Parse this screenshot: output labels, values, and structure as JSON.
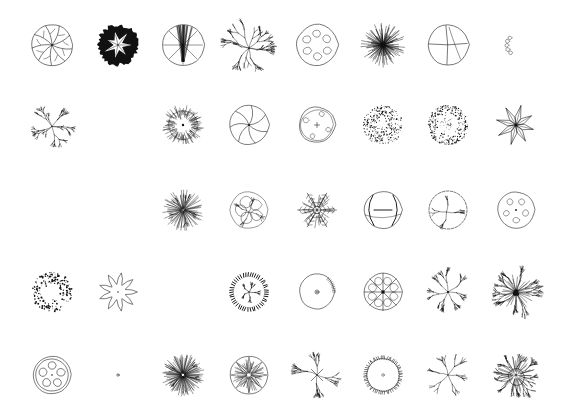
{
  "sheet": {
    "title": "Tree Plan Symbols Reference Sheet",
    "background_color": "#ffffff",
    "ink_color": "#111111",
    "width": 574,
    "height": 417,
    "columns": 8,
    "rows": 5,
    "total_symbols": 40,
    "column_centers_x": [
      52,
      118,
      183,
      249,
      317,
      383,
      448,
      516
    ],
    "row_centers_y": [
      45,
      125,
      210,
      292,
      375
    ]
  },
  "symbols": [
    {
      "id": "r1c1",
      "row": 1,
      "col": 1,
      "cx": 52,
      "cy": 45,
      "size": 52,
      "style": "segmented-canopy",
      "label": "Segmented canopy with radiating veins"
    },
    {
      "id": "r1c2",
      "row": 1,
      "col": 2,
      "cx": 118,
      "cy": 45,
      "size": 52,
      "style": "solid-filled-leaf",
      "label": "Solid filled canopy with white leaf center"
    },
    {
      "id": "r1c3",
      "row": 1,
      "col": 3,
      "cx": 183,
      "cy": 45,
      "size": 52,
      "style": "radial-trunk-lines",
      "label": "Circle with fine radial trunk lines"
    },
    {
      "id": "r1c4",
      "row": 1,
      "col": 4,
      "cx": 249,
      "cy": 45,
      "size": 52,
      "style": "open-branching",
      "label": "Open branching deciduous tree"
    },
    {
      "id": "r1c5",
      "row": 1,
      "col": 5,
      "cx": 317,
      "cy": 45,
      "size": 52,
      "style": "blobby-cloud",
      "label": "Cloud outline with interior blobs"
    },
    {
      "id": "r1c6",
      "row": 1,
      "col": 6,
      "cx": 383,
      "cy": 45,
      "size": 52,
      "style": "starburst-dense",
      "label": "Dense starburst conifer"
    },
    {
      "id": "r1c7",
      "row": 1,
      "col": 7,
      "cx": 448,
      "cy": 45,
      "size": 52,
      "style": "quartered-circle",
      "label": "Circle quartered by cross lines"
    },
    {
      "id": "r1c8",
      "row": 1,
      "col": 8,
      "cx": 516,
      "cy": 45,
      "size": 52,
      "style": "scalloped-shrub",
      "label": "Scalloped shrub mass outline"
    },
    {
      "id": "r2c1",
      "row": 2,
      "col": 1,
      "cx": 52,
      "cy": 125,
      "size": 50,
      "style": "bare-branch",
      "label": "Bare branching structure"
    },
    {
      "id": "r2c2",
      "row": 2,
      "col": 2,
      "cx": 118,
      "cy": 125,
      "size": 50,
      "style": "lobed-outline",
      "label": "Lobed cloud outline, open"
    },
    {
      "id": "r2c3",
      "row": 2,
      "col": 3,
      "cx": 183,
      "cy": 125,
      "size": 50,
      "style": "spiky-ring-dot",
      "label": "Spiky ring with center dot"
    },
    {
      "id": "r2c4",
      "row": 2,
      "col": 4,
      "cx": 249,
      "cy": 125,
      "size": 50,
      "style": "pinwheel-segments",
      "label": "Pinwheel segmented canopy"
    },
    {
      "id": "r2c5",
      "row": 2,
      "col": 5,
      "cx": 317,
      "cy": 125,
      "size": 50,
      "style": "soft-blob-cross",
      "label": "Soft blob outline with cross center"
    },
    {
      "id": "r2c6",
      "row": 2,
      "col": 6,
      "cx": 383,
      "cy": 125,
      "size": 50,
      "style": "stipple-disc",
      "label": "Stippled texture disc"
    },
    {
      "id": "r2c7",
      "row": 2,
      "col": 7,
      "cx": 448,
      "cy": 125,
      "size": 50,
      "style": "stipple-ring",
      "label": "Stippled ring, open center"
    },
    {
      "id": "r2c8",
      "row": 2,
      "col": 8,
      "cx": 516,
      "cy": 125,
      "size": 50,
      "style": "palm-star",
      "label": "Palm / spiky star frond"
    },
    {
      "id": "r3c1",
      "row": 3,
      "col": 1,
      "cx": 52,
      "cy": 210,
      "size": 50,
      "style": "wavy-outline",
      "label": "Wavy scalloped outline"
    },
    {
      "id": "r3c2",
      "row": 3,
      "col": 2,
      "cx": 118,
      "cy": 210,
      "size": 50,
      "style": "crinkle-outline",
      "label": "Fine crinkled outline"
    },
    {
      "id": "r3c3",
      "row": 3,
      "col": 3,
      "cx": 183,
      "cy": 210,
      "size": 50,
      "style": "fine-radial-branch",
      "label": "Fine radial branch texture"
    },
    {
      "id": "r3c4",
      "row": 3,
      "col": 4,
      "cx": 249,
      "cy": 210,
      "size": 50,
      "style": "sketchy-canopy",
      "label": "Loose sketchy canopy patches"
    },
    {
      "id": "r3c5",
      "row": 3,
      "col": 5,
      "cx": 317,
      "cy": 210,
      "size": 50,
      "style": "snowflake-conifer",
      "label": "Snowflake-like conifer"
    },
    {
      "id": "r3c6",
      "row": 3,
      "col": 6,
      "cx": 383,
      "cy": 210,
      "size": 50,
      "style": "bold-loop-circle",
      "label": "Circle with bold interior loops"
    },
    {
      "id": "r3c7",
      "row": 3,
      "col": 7,
      "cx": 448,
      "cy": 210,
      "size": 50,
      "style": "dashed-circle-branch",
      "label": "Dashed circle with branches"
    },
    {
      "id": "r3c8",
      "row": 3,
      "col": 8,
      "cx": 516,
      "cy": 210,
      "size": 50,
      "style": "bubble-circle",
      "label": "Circle with small bubble shapes"
    },
    {
      "id": "r4c1",
      "row": 4,
      "col": 1,
      "cx": 52,
      "cy": 292,
      "size": 50,
      "style": "scatter-stipple-c",
      "label": "Scattered stipple crescent"
    },
    {
      "id": "r4c2",
      "row": 4,
      "col": 2,
      "cx": 118,
      "cy": 292,
      "size": 50,
      "style": "petal-flower",
      "label": "Petal flower rosette"
    },
    {
      "id": "r4c3",
      "row": 4,
      "col": 3,
      "cx": 183,
      "cy": 292,
      "size": 50,
      "style": "plain-lobed",
      "label": "Plain lobed outline"
    },
    {
      "id": "r4c4",
      "row": 4,
      "col": 4,
      "cx": 249,
      "cy": 292,
      "size": 50,
      "style": "dash-ring-branch",
      "label": "Dashed tick ring with branch center"
    },
    {
      "id": "r4c5",
      "row": 4,
      "col": 5,
      "cx": 317,
      "cy": 292,
      "size": 50,
      "style": "blob-eye-dot",
      "label": "Blob outline with ringed center dot"
    },
    {
      "id": "r4c6",
      "row": 4,
      "col": 6,
      "cx": 383,
      "cy": 292,
      "size": 50,
      "style": "radial-cell-circle",
      "label": "Circle with radial cell pattern"
    },
    {
      "id": "r4c7",
      "row": 4,
      "col": 7,
      "cx": 448,
      "cy": 292,
      "size": 50,
      "style": "fine-twig-spray",
      "label": "Fine twig spray"
    },
    {
      "id": "r4c8",
      "row": 4,
      "col": 8,
      "cx": 516,
      "cy": 292,
      "size": 50,
      "style": "dark-core-spray",
      "label": "Dark core radiating spray"
    },
    {
      "id": "r5c1",
      "row": 5,
      "col": 1,
      "cx": 52,
      "cy": 375,
      "size": 50,
      "style": "double-ring-petals",
      "label": "Double ring with five petal voids"
    },
    {
      "id": "r5c2",
      "row": 5,
      "col": 2,
      "cx": 118,
      "cy": 375,
      "size": 50,
      "style": "cloud-dot",
      "label": "Cloud outline with center dot"
    },
    {
      "id": "r5c3",
      "row": 5,
      "col": 3,
      "cx": 183,
      "cy": 375,
      "size": 50,
      "style": "shaggy-dense",
      "label": "Shaggy dense canopy"
    },
    {
      "id": "r5c4",
      "row": 5,
      "col": 4,
      "cx": 249,
      "cy": 375,
      "size": 50,
      "style": "star-in-circle",
      "label": "Star burst inside circle"
    },
    {
      "id": "r5c5",
      "row": 5,
      "col": 5,
      "cx": 317,
      "cy": 375,
      "size": 50,
      "style": "cross-spray",
      "label": "Cross-centered spray"
    },
    {
      "id": "r5c6",
      "row": 5,
      "col": 6,
      "cx": 383,
      "cy": 375,
      "size": 50,
      "style": "tick-ring-dot",
      "label": "Tick-edged ring with center dot"
    },
    {
      "id": "r5c7",
      "row": 5,
      "col": 7,
      "cx": 448,
      "cy": 375,
      "size": 50,
      "style": "sparse-spray",
      "label": "Sparse open spray"
    },
    {
      "id": "r5c8",
      "row": 5,
      "col": 8,
      "cx": 516,
      "cy": 375,
      "size": 50,
      "style": "layered-branch-mass",
      "label": "Layered branch mass"
    }
  ]
}
